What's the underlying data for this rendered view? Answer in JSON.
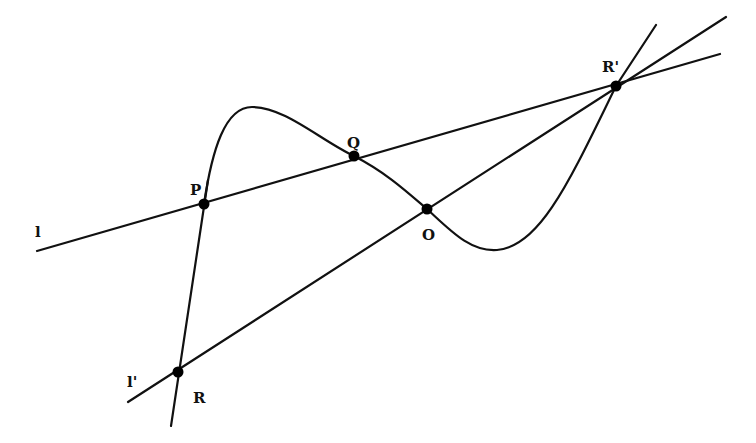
{
  "diagram": {
    "title": "",
    "labels": {
      "P": "P",
      "Q": "Q",
      "O": "O",
      "R": "R",
      "R_prime": "R'",
      "l": "l",
      "l_prime": "l'"
    },
    "points": [
      {
        "name": "P",
        "x": 204,
        "y": 204
      },
      {
        "name": "Q",
        "x": 354,
        "y": 156
      },
      {
        "name": "O",
        "x": 427,
        "y": 209
      },
      {
        "name": "R",
        "x": 178,
        "y": 372
      },
      {
        "name": "R'",
        "x": 616,
        "y": 86
      }
    ],
    "lines": [
      {
        "name": "l",
        "through": [
          "P",
          "Q",
          "R'"
        ]
      },
      {
        "name": "l'",
        "through": [
          "R",
          "O",
          "R'"
        ]
      },
      {
        "name": "PR",
        "through": [
          "P",
          "R"
        ]
      }
    ],
    "curve": "cubic curve through P, Q, O, R'",
    "colors": {
      "stroke": "#111111",
      "background": "#ffffff"
    }
  }
}
